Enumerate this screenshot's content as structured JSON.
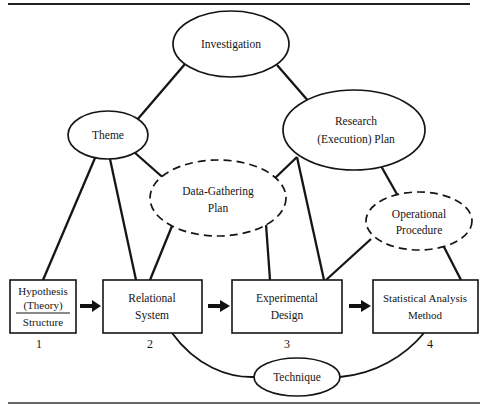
{
  "figure": {
    "type": "flow-diagram",
    "background_color": "#ffffff",
    "ink_color": "#151515"
  },
  "nodes": {
    "investigation": {
      "label": "Investigation",
      "shape": "ellipse",
      "style": "solid",
      "cx": 231,
      "cy": 44,
      "rx": 58,
      "ry": 33
    },
    "theme": {
      "label": "Theme",
      "shape": "ellipse",
      "style": "solid",
      "cx": 108,
      "cy": 135,
      "rx": 40,
      "ry": 24
    },
    "research_plan": {
      "label_line1": "Research",
      "label_line2": "(Execution) Plan",
      "shape": "ellipse",
      "style": "solid",
      "cx": 354,
      "cy": 130,
      "rx": 71,
      "ry": 40
    },
    "data_gathering_plan": {
      "label_line1": "Data-Gathering",
      "label_line2": "Plan",
      "shape": "ellipse",
      "style": "dashed",
      "cx": 218,
      "cy": 198,
      "rx": 68,
      "ry": 38
    },
    "operational_procedure": {
      "label_line1": "Operational",
      "label_line2": "Procedure",
      "shape": "ellipse",
      "style": "dashed",
      "cx": 419,
      "cy": 221,
      "rx": 53,
      "ry": 29
    },
    "technique": {
      "label": "Technique",
      "shape": "ellipse",
      "style": "solid",
      "cx": 297,
      "cy": 377,
      "rx": 43,
      "ry": 19
    }
  },
  "boxes": [
    {
      "id": "hypothesis",
      "number": "1",
      "numerator_line1": "Hypothesis",
      "numerator_line2": "(Theory)",
      "denominator": "Structure",
      "fraction": true,
      "x": 10,
      "y": 280,
      "w": 66,
      "h": 53
    },
    {
      "id": "relational-system",
      "number": "2",
      "line1": "Relational",
      "line2": "System",
      "fraction": false,
      "x": 103,
      "y": 280,
      "w": 99,
      "h": 53
    },
    {
      "id": "experimental-design",
      "number": "3",
      "line1": "Experimental",
      "line2": "Design",
      "fraction": false,
      "x": 232,
      "y": 280,
      "w": 110,
      "h": 53
    },
    {
      "id": "statistical-analysis",
      "number": "4",
      "line1": "Statistical Analysis",
      "line2": "Method",
      "fraction": false,
      "x": 373,
      "y": 280,
      "w": 105,
      "h": 53
    }
  ],
  "arrows": [
    {
      "id": "arrow-1-2",
      "from": "hypothesis",
      "to": "relational-system",
      "x": 80,
      "y": 306
    },
    {
      "id": "arrow-2-3",
      "from": "relational-system",
      "to": "experimental-design",
      "x": 207,
      "y": 306
    },
    {
      "id": "arrow-3-4",
      "from": "experimental-design",
      "to": "statistical-analysis",
      "x": 347,
      "y": 306
    }
  ],
  "links": [
    {
      "id": "theme-investigation",
      "from": "theme",
      "to": "investigation"
    },
    {
      "id": "investigation-research-plan",
      "from": "investigation",
      "to": "research_plan"
    },
    {
      "id": "theme-hypothesis",
      "from": "theme",
      "to": "hypothesis"
    },
    {
      "id": "theme-relational-system",
      "from": "theme",
      "to": "relational-system"
    },
    {
      "id": "theme-data-gathering-plan",
      "from": "theme",
      "to": "data_gathering_plan"
    },
    {
      "id": "data-gathering-plan-relational-system",
      "from": "data_gathering_plan",
      "to": "relational-system"
    },
    {
      "id": "data-gathering-plan-experimental-design",
      "from": "data_gathering_plan",
      "to": "experimental-design"
    },
    {
      "id": "research-plan-experimental-design",
      "from": "research_plan",
      "to": "experimental-design"
    },
    {
      "id": "research-plan-operational-procedure",
      "from": "research_plan",
      "to": "operational_procedure"
    },
    {
      "id": "operational-procedure-experimental-design",
      "from": "operational_procedure",
      "to": "experimental-design"
    },
    {
      "id": "operational-procedure-statistical-analysis",
      "from": "operational_procedure",
      "to": "statistical-analysis"
    },
    {
      "id": "relational-system-technique",
      "from": "relational-system",
      "to": "technique",
      "curved": true
    },
    {
      "id": "technique-statistical-analysis",
      "from": "technique",
      "to": "statistical-analysis",
      "curved": true
    }
  ],
  "rules": {
    "top": {
      "x1": 8,
      "y1": 4,
      "x2": 470,
      "y2": 4
    },
    "bottom": {
      "x1": 8,
      "y1": 403,
      "x2": 480,
      "y2": 403
    }
  }
}
